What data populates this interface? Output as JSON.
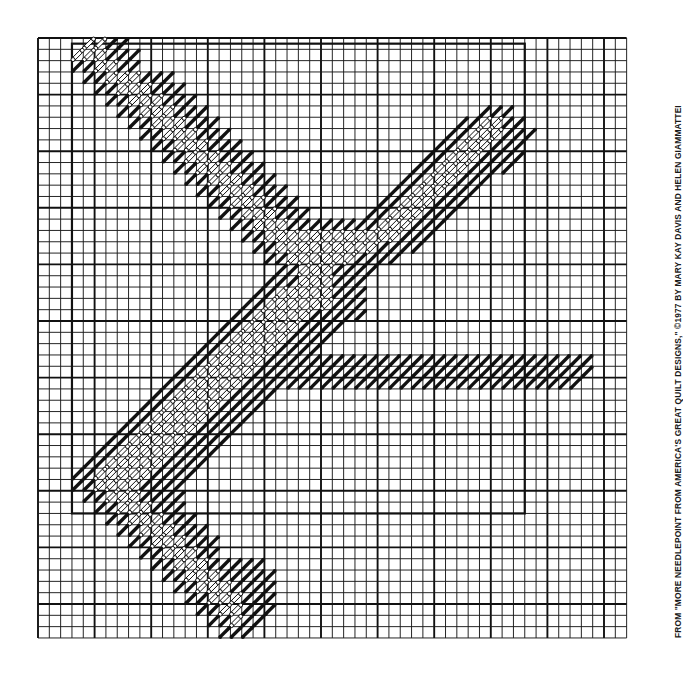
{
  "document": {
    "kind": "needlepoint-chart",
    "title": "Needlepoint Quilt Design Chart",
    "credit": "FROM \"MORE NEEDLEPOINT FROM AMERICA'S GREAT QUILT DESIGNS,\" ©1977 BY MARY KAY DAVIS AND HELEN GIAMMATTEI"
  },
  "colors": {
    "grid_line": "#1a1a1a",
    "grid_line_heavy": "#111111",
    "stitch_filled": "#111111",
    "stitch_open_stroke": "#111111",
    "stitch_open_fill": "#ffffff",
    "paper": "#ffffff",
    "border": "#111111"
  },
  "chart_data": {
    "type": "heatmap",
    "xlabel": "",
    "ylabel": "",
    "grid": {
      "cols": 52,
      "rows": 53,
      "cell_px": 11.32,
      "origin_x": 38,
      "origin_y": 38,
      "heavy_every": 5,
      "grid_on": true
    },
    "inner_border": {
      "col_start": 3,
      "row_start": 0.5,
      "col_end": 43,
      "row_end": 42,
      "stroke_px": 2.2
    },
    "legend": [
      {
        "key": "F",
        "name": "filled-stitch",
        "description": "solid black diagonal stitch"
      },
      {
        "key": "O",
        "name": "open-stitch",
        "description": "outlined white diagonal stitch"
      },
      {
        "key": ".",
        "name": "empty-cell",
        "description": "unworked canvas"
      }
    ],
    "legend_position": "none",
    "rows_encoding": [
      "....OOFF............................................",
      "...OOOFFF...........................................",
      "...FFOOFF...........................................",
      "....FFOOOFFF........................................",
      ".....FFOOOFFF.......................................",
      "......FFOOOFFF......................................",
      ".......FFOOOFFF........................FFF..........",
      "........FFOOOFFF.....................FFOOFF.........",
      ".........FFOOOFFF...................FFOOOFFF........",
      "..........FFOOOFFF.................FFOOOFFF.........",
      "...........FFOOOFFF...............FFOOOFFFF.........",
      "............FFOOOFFF.............FFOOOFFFF..........",
      ".............FFOOOFFF...........FFOOOFFF............",
      "..............FFOOOFFF.........FFOOOFFF.............",
      "...............FFOOOFFF.......FFOOOFFF..............",
      "................FFOOOFFF.....FFOOOFFF...............",
      ".................FFOOOFFFFFFFFOOOFFF................",
      "..................FFOOOOOOOOOOOOFFF.................",
      "...................FFOOOOOOOOOFFFF.................",
      "....................FFOOOOOOFFFF....................",
      ".....................FFOOOFFFF......................",
      "....................FFFOOOFFF.......................",
      "...................FFOOOOOFFF.......................",
      "..................FFOOOOOOFFF.......................",
      ".................FFOOOOOFFFFF.......................",
      "................FFOOOOOFFFF.........................",
      "...............FFOOOOOFFFF..........................",
      "..............FFOOOOOFFFF...........................",
      ".............FFOOOOOFFFFFFFFFFFFFFFFFFFFFFFFFFFFF...",
      "............FFOOOOOFFFFFFFFFFFFFFFFFFFFFFFFFFFFFF...",
      "...........FFOOOOOFFFFFFFFFFFFFFFFFFFFFFFFFFFFFF....",
      "..........FFOOOOOFFFF...............................",
      ".........FFOOOOOFFFF................................",
      "........FFOOOOOFFFF.................................",
      ".......FFOOOOOFFFF..................................",
      "......FFOOOOOFFFF...................................",
      ".....FFOOOOOFFFF....................................",
      "....FFOOOOOFFFF.....................................",
      "...FFOOOOOFFFF......................................",
      "...FFOOOOFFFF.......................................",
      "....FFOOOFFFF.......................................",
      ".....FFOOOFFF.......................................",
      "......FFOOOFFF......................................",
      ".......FFOOOFFF.....................................",
      "........FFOOOFFF....................................",
      ".........FFOOOFF....................................",
      "..........FFOOOFFFFF................................",
      "...........FFOOOFFFFF...............................",
      "............FFOOOFFFF...............................",
      ".............FFOOOFFF...............................",
      "..............FFOOFFF...............................",
      "...............FFOFF................................",
      "................FFF................................."
    ]
  }
}
